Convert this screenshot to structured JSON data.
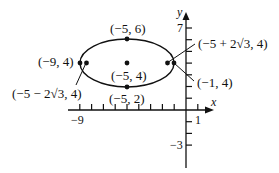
{
  "figure": {
    "type": "ellipse-graph",
    "equation_hint": "center (-5,4), horizontal major axis",
    "axes": {
      "x_label": "x",
      "y_label": "y",
      "x_tick_labels": {
        "left": "−9",
        "right": "1"
      },
      "y_tick_labels": {
        "top": "7",
        "bottom": "−3"
      },
      "x_range": [
        -10,
        2
      ],
      "y_range": [
        -4,
        8
      ]
    },
    "ellipse": {
      "center": [
        -5,
        4
      ],
      "semi_major": 4,
      "semi_minor": 2
    },
    "points": [
      {
        "id": "top-vertex",
        "coords": [
          -5,
          6
        ],
        "label": "(−5, 6)"
      },
      {
        "id": "center",
        "coords": [
          -5,
          4
        ],
        "label": "(−5, 4)"
      },
      {
        "id": "bottom-vertex",
        "coords": [
          -5,
          2
        ],
        "label": "(−5, 2)"
      },
      {
        "id": "left-vertex",
        "coords": [
          -9,
          4
        ],
        "label": "(−9, 4)"
      },
      {
        "id": "right-vertex",
        "coords": [
          -1,
          4
        ],
        "label": "(−1, 4)"
      },
      {
        "id": "left-focus",
        "coords": [
          -8.464,
          4
        ],
        "label": "(−5 − 2√3, 4)"
      },
      {
        "id": "right-focus",
        "coords": [
          -1.536,
          4
        ],
        "label": "(−5 + 2√3, 4)"
      }
    ],
    "colors": {
      "ink": "#111111",
      "background": "#ffffff"
    }
  }
}
